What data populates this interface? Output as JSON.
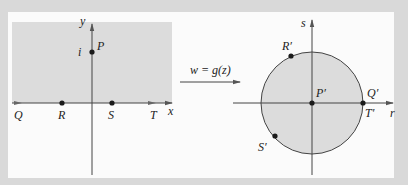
{
  "figure": {
    "left_plane": {
      "x_axis_label": "x",
      "y_axis_label": "y",
      "region": "upper half-plane (shaded)",
      "points": [
        {
          "name": "P",
          "label": "P",
          "value_label": "i"
        },
        {
          "name": "Q",
          "label": "Q"
        },
        {
          "name": "R",
          "label": "R"
        },
        {
          "name": "S",
          "label": "S"
        },
        {
          "name": "T",
          "label": "T"
        }
      ]
    },
    "mapping": {
      "label": "w = g(z)"
    },
    "right_plane": {
      "r_axis_label": "r",
      "s_axis_label": "s",
      "region": "unit disk (shaded)",
      "points": [
        {
          "name": "P-prime",
          "label": "P′"
        },
        {
          "name": "Q-prime",
          "label": "Q′"
        },
        {
          "name": "R-prime",
          "label": "R′"
        },
        {
          "name": "S-prime",
          "label": "S′"
        },
        {
          "name": "T-prime",
          "label": "T′"
        }
      ]
    }
  },
  "colors": {
    "frame": "#d9d9d9",
    "panel": "#fbfbfb",
    "shade": "#dcdcdc",
    "ink": "#2a2a2a"
  }
}
